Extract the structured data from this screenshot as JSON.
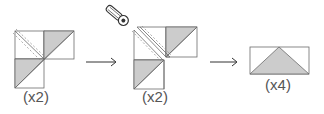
{
  "diagram": {
    "colors": {
      "outline": "#6b6b6b",
      "fill": "#cccccc",
      "background": "#ffffff",
      "text": "#555555",
      "seam": "#8a8a8a"
    },
    "steps": [
      {
        "id": "step-1",
        "description": "Three HST squares arranged in an L, sewn along diagonal",
        "label": "(x2)"
      },
      {
        "id": "step-2",
        "description": "Cut between stitched lines with rotary cutter",
        "label": "(x2)",
        "icon": "rotary-cutter-icon"
      },
      {
        "id": "step-3",
        "description": "Resulting flying geese unit",
        "label": "(x4)"
      }
    ],
    "arrows": [
      {
        "id": "arrow-1",
        "from": "step-1",
        "to": "step-2"
      },
      {
        "id": "arrow-2",
        "from": "step-2",
        "to": "step-3"
      }
    ]
  }
}
